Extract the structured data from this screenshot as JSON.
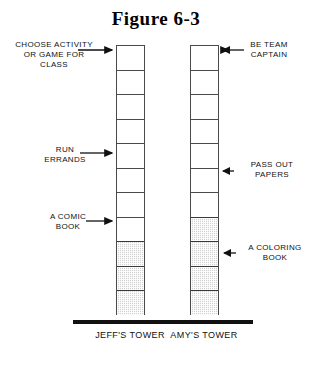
{
  "figure": {
    "title": "Figure 6-3"
  },
  "towers": [
    {
      "id": "jeff",
      "caption": "JEFF'S\nTOWER",
      "total_blocks": 11,
      "white_blocks": 8,
      "shaded_blocks": 3,
      "blocks": [
        {
          "shaded": false
        },
        {
          "shaded": false
        },
        {
          "shaded": false
        },
        {
          "shaded": false
        },
        {
          "shaded": false
        },
        {
          "shaded": false
        },
        {
          "shaded": false
        },
        {
          "shaded": false
        },
        {
          "shaded": true
        },
        {
          "shaded": true
        },
        {
          "shaded": true
        }
      ]
    },
    {
      "id": "amy",
      "caption": "AMY'S\nTOWER",
      "total_blocks": 11,
      "white_blocks": 7,
      "shaded_blocks": 4,
      "blocks": [
        {
          "shaded": false
        },
        {
          "shaded": false
        },
        {
          "shaded": false
        },
        {
          "shaded": false
        },
        {
          "shaded": false
        },
        {
          "shaded": false
        },
        {
          "shaded": false
        },
        {
          "shaded": true
        },
        {
          "shaded": true
        },
        {
          "shaded": true
        },
        {
          "shaded": true
        }
      ]
    }
  ],
  "callouts": {
    "left": [
      {
        "id": "choose",
        "text": "CHOOSE ACTIVITY\nOR GAME FOR\nCLASS"
      },
      {
        "id": "run",
        "text": "RUN\nERRANDS"
      },
      {
        "id": "comic",
        "text": "A COMIC\nBOOK"
      }
    ],
    "right": [
      {
        "id": "team",
        "text": "BE TEAM\nCAPTAIN"
      },
      {
        "id": "pass",
        "text": "PASS OUT\nPAPERS"
      },
      {
        "id": "coloring",
        "text": "A COLORING\nBOOK"
      }
    ]
  },
  "colors": {
    "line": "#4a4a4a",
    "ground": "#111111",
    "shade_fill": "#d2d2d2",
    "text": "#111111",
    "background": "#ffffff"
  },
  "chart_data": {
    "type": "bar",
    "title": "Figure 6-3",
    "categories": [
      "JEFF'S TOWER",
      "AMY'S TOWER"
    ],
    "series": [
      {
        "name": "white blocks",
        "values": [
          8,
          7
        ]
      },
      {
        "name": "shaded blocks",
        "values": [
          3,
          4
        ]
      }
    ],
    "values": [
      11,
      11
    ],
    "xlabel": "",
    "ylabel": "",
    "ylim": [
      0,
      11
    ],
    "grid": false,
    "legend": "none",
    "annotations": [
      {
        "text": "CHOOSE ACTIVITY OR GAME FOR CLASS",
        "side": "left",
        "target": "JEFF'S TOWER",
        "block_from_top": 1
      },
      {
        "text": "RUN ERRANDS",
        "side": "left",
        "target": "JEFF'S TOWER",
        "block_from_top": 5
      },
      {
        "text": "A COMIC BOOK",
        "side": "left",
        "target": "JEFF'S TOWER",
        "block_from_top": 8
      },
      {
        "text": "BE TEAM CAPTAIN",
        "side": "right",
        "target": "AMY'S TOWER",
        "block_from_top": 1
      },
      {
        "text": "PASS OUT PAPERS",
        "side": "right",
        "target": "AMY'S TOWER",
        "block_from_top": 6
      },
      {
        "text": "A COLORING BOOK",
        "side": "right",
        "target": "AMY'S TOWER",
        "block_from_top": 9
      }
    ]
  }
}
